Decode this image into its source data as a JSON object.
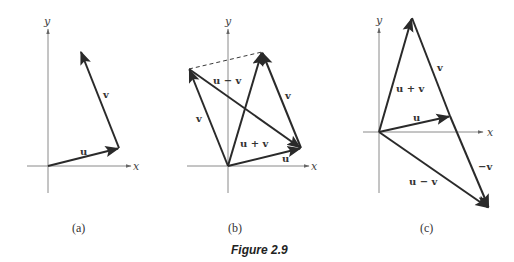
{
  "figure": {
    "title": "Figure 2.9",
    "panels": [
      {
        "id": "a",
        "caption": "(a)",
        "axes": {
          "x_label": "x",
          "y_label": "y"
        },
        "vectors": [
          {
            "name": "u",
            "label": "u",
            "from": [
              48,
              166
            ],
            "to": [
              119,
              148
            ]
          },
          {
            "name": "v",
            "label": "v",
            "from": [
              119,
              148
            ],
            "to": [
              80,
              50
            ]
          }
        ]
      },
      {
        "id": "b",
        "caption": "(b)",
        "axes": {
          "x_label": "x",
          "y_label": "y"
        },
        "vectors": [
          {
            "name": "u",
            "label": "u",
            "from": [
              228,
              166
            ],
            "to": [
              301,
              148
            ]
          },
          {
            "name": "v-left",
            "label": "v",
            "from": [
              228,
              166
            ],
            "to": [
              189,
              69
            ]
          },
          {
            "name": "v-right",
            "label": "v",
            "from": [
              301,
              148
            ],
            "to": [
              262,
              52
            ]
          },
          {
            "name": "u-plus-v",
            "label": "u + v",
            "from": [
              228,
              166
            ],
            "to": [
              262,
              52
            ]
          },
          {
            "name": "u-minus-v",
            "label": "u − v",
            "from": [
              189,
              69
            ],
            "to": [
              301,
              148
            ]
          }
        ]
      },
      {
        "id": "c",
        "caption": "(c)",
        "axes": {
          "x_label": "x",
          "y_label": "y"
        },
        "vectors": [
          {
            "name": "u",
            "label": "u",
            "from": [
              379,
              132
            ],
            "to": [
              450,
              116
            ]
          },
          {
            "name": "u-plus-v",
            "label": "u + v",
            "from": [
              379,
              132
            ],
            "to": [
              412,
              18
            ]
          },
          {
            "name": "v",
            "label": "v",
            "from": [
              450,
              116
            ],
            "to": [
              412,
              18
            ]
          },
          {
            "name": "neg-v",
            "label": "−v",
            "from": [
              450,
              116
            ],
            "to": [
              489,
              208
            ]
          },
          {
            "name": "u-minus-v",
            "label": "u − v",
            "from": [
              379,
              132
            ],
            "to": [
              489,
              208
            ]
          }
        ]
      }
    ]
  }
}
